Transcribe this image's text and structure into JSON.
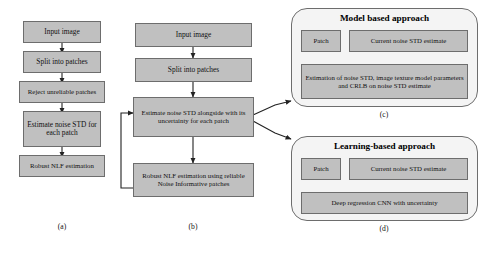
{
  "figure": {
    "background_color": "#ffffff",
    "box_fill_color": "#c0c0c0",
    "box_border_color": "#6d6d6d",
    "panel_fill_color": "#f4f4f4",
    "arrow_color": "#222222"
  },
  "columns": {
    "a": {
      "caption": "(a)",
      "boxes": [
        {
          "id": "a1",
          "label": "Input image"
        },
        {
          "id": "a2",
          "label": "Split into patches"
        },
        {
          "id": "a3",
          "label": "Reject unreliable patches"
        },
        {
          "id": "a4",
          "label": "Estimate noise STD for each patch"
        },
        {
          "id": "a5",
          "label": "Robust NLF estimation"
        }
      ]
    },
    "b": {
      "caption": "(b)",
      "boxes": [
        {
          "id": "b1",
          "label": "Input image"
        },
        {
          "id": "b2",
          "label": "Split into patches"
        },
        {
          "id": "b3",
          "label": "Estimate noise STD alongside with its uncertainty for each patch"
        },
        {
          "id": "b4",
          "label": "Robust NLF estimation using reliable Noise Informative patches"
        }
      ]
    }
  },
  "panels": {
    "c": {
      "caption": "(c)",
      "title": "Model based approach",
      "boxes": [
        {
          "id": "c1",
          "label": "Patch"
        },
        {
          "id": "c2",
          "label": "Current noise STD estimate"
        },
        {
          "id": "c3",
          "label": "Estimation of noise STD, image texture model parameters and CRLB on noise STD estimate"
        }
      ]
    },
    "d": {
      "caption": "(d)",
      "title": "Learning-based approach",
      "boxes": [
        {
          "id": "d1",
          "label": "Patch"
        },
        {
          "id": "d2",
          "label": "Current noise STD estimate"
        },
        {
          "id": "d3",
          "label": "Deep regression CNN with uncertainty"
        }
      ]
    }
  }
}
